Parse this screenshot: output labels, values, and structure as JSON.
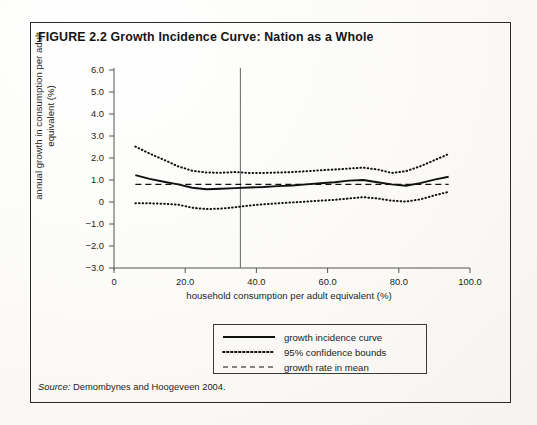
{
  "figure": {
    "number": "FIGURE 2.2",
    "title": "Growth Incidence Curve: Nation as a Whole",
    "full_title": "FIGURE 2.2  Growth Incidence Curve: Nation as a Whole",
    "source_prefix": "Source:",
    "source_text": " Demombynes and Hoogeveen 2004."
  },
  "legend": {
    "items": [
      {
        "label": "growth incidence curve",
        "style": "solid",
        "key_name": "solid-line-key"
      },
      {
        "label": "95% confidence bounds",
        "style": "dotted",
        "key_name": "dotted-line-key"
      },
      {
        "label": "growth rate in mean",
        "style": "dashed",
        "key_name": "dashed-line-key"
      }
    ]
  },
  "chart_data": {
    "type": "line",
    "title": "Growth Incidence Curve: Nation as a Whole",
    "xlabel": "household consumption per adult equivalent (%)",
    "ylabel": "annual growth in consumption per adult equivalent (%)",
    "xlim": [
      0,
      100
    ],
    "ylim": [
      -3.0,
      6.0
    ],
    "grid": false,
    "legend_position": "below-axes-center",
    "xticks": [
      0,
      20,
      40,
      60,
      80,
      100
    ],
    "xtick_labels": [
      "0",
      "20.0",
      "40.0",
      "60.0",
      "80.0",
      "100.0"
    ],
    "yticks": [
      6.0,
      5.0,
      4.0,
      3.0,
      2.0,
      1.0,
      0,
      -1.0,
      -2.0,
      -3.0
    ],
    "ytick_labels": [
      "6.0",
      "5.0",
      "4.0",
      "3.0",
      "2.0",
      "1.0",
      "0",
      "-1.0",
      "-2.0",
      "-3.0"
    ],
    "annotations": [
      {
        "name": "vertical-reference-line",
        "type": "vline",
        "x": 35.5
      }
    ],
    "x": [
      6,
      10,
      14,
      18,
      22,
      26,
      30,
      34,
      38,
      42,
      46,
      50,
      54,
      58,
      62,
      66,
      70,
      74,
      78,
      82,
      86,
      90,
      94
    ],
    "series": [
      {
        "name": "growth incidence curve",
        "style": "solid",
        "values": [
          1.22,
          1.05,
          0.92,
          0.8,
          0.65,
          0.58,
          0.6,
          0.63,
          0.66,
          0.68,
          0.72,
          0.75,
          0.8,
          0.85,
          0.9,
          0.97,
          1.0,
          0.9,
          0.8,
          0.74,
          0.86,
          1.02,
          1.15
        ]
      },
      {
        "name": "95% confidence upper bound",
        "style": "dotted",
        "values": [
          2.52,
          2.2,
          1.92,
          1.62,
          1.42,
          1.34,
          1.33,
          1.36,
          1.32,
          1.32,
          1.34,
          1.36,
          1.4,
          1.44,
          1.48,
          1.52,
          1.56,
          1.48,
          1.32,
          1.4,
          1.62,
          1.9,
          2.18
        ]
      },
      {
        "name": "95% confidence lower bound",
        "style": "dotted",
        "values": [
          -0.06,
          -0.06,
          -0.08,
          -0.12,
          -0.26,
          -0.32,
          -0.3,
          -0.24,
          -0.16,
          -0.1,
          -0.06,
          -0.02,
          0.02,
          0.06,
          0.1,
          0.16,
          0.22,
          0.16,
          0.06,
          0.02,
          0.12,
          0.3,
          0.46
        ]
      },
      {
        "name": "growth rate in mean",
        "style": "dashed",
        "values": [
          0.8,
          0.8,
          0.8,
          0.8,
          0.8,
          0.8,
          0.8,
          0.8,
          0.8,
          0.8,
          0.8,
          0.8,
          0.8,
          0.8,
          0.8,
          0.8,
          0.8,
          0.8,
          0.8,
          0.8,
          0.8,
          0.8,
          0.8
        ]
      }
    ]
  }
}
